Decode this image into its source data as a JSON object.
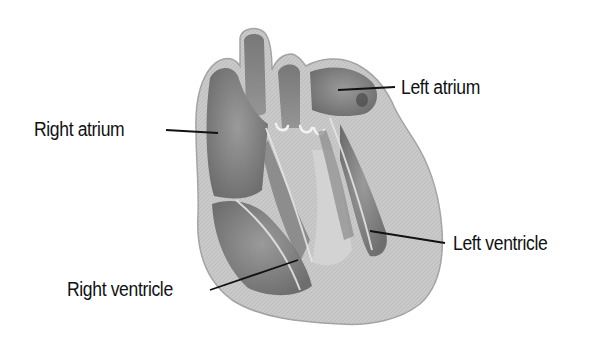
{
  "figure": {
    "labels": [
      {
        "id": "right-atrium",
        "text": "Right atrium"
      },
      {
        "id": "left-atrium",
        "text": "Left atrium"
      },
      {
        "id": "left-ventricle",
        "text": "Left ventricle"
      },
      {
        "id": "right-ventricle",
        "text": "Right ventricle"
      }
    ]
  },
  "colors": {
    "background": "#ffffff",
    "wall": "#c9c9c9",
    "wall_edge": "#9a9a9a",
    "chamber": "#7d7d7d",
    "chamber_dark": "#5f5f5f",
    "septum": "#d6d6d6",
    "leader_line": "#111111",
    "label_text": "#111111"
  }
}
